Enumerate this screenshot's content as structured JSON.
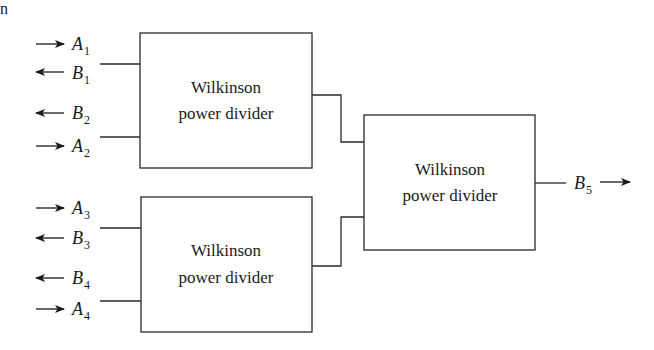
{
  "fragment": "n",
  "blocks": [
    {
      "id": "top",
      "line1": "Wilkinson",
      "line2": "power divider"
    },
    {
      "id": "bottom",
      "line1": "Wilkinson",
      "line2": "power divider"
    },
    {
      "id": "combiner",
      "line1": "Wilkinson",
      "line2": "power divider"
    }
  ],
  "ports": [
    {
      "letter": "A",
      "sub": "1",
      "direction": "in"
    },
    {
      "letter": "B",
      "sub": "1",
      "direction": "out"
    },
    {
      "letter": "B",
      "sub": "2",
      "direction": "out"
    },
    {
      "letter": "A",
      "sub": "2",
      "direction": "in"
    },
    {
      "letter": "A",
      "sub": "3",
      "direction": "in"
    },
    {
      "letter": "B",
      "sub": "3",
      "direction": "out"
    },
    {
      "letter": "B",
      "sub": "4",
      "direction": "out"
    },
    {
      "letter": "A",
      "sub": "4",
      "direction": "in"
    }
  ],
  "output": {
    "letter": "B",
    "sub": "5",
    "direction": "out"
  },
  "colors": {
    "line": "#2a2a2a",
    "background": "#ffffff"
  }
}
